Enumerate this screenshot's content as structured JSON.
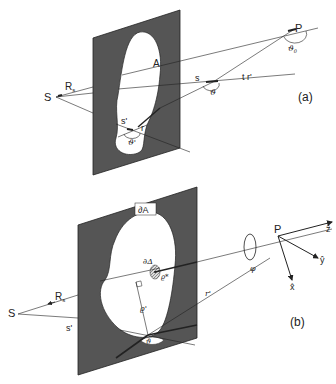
{
  "figure_a": {
    "panel_label": "(a)",
    "labels": {
      "source": "S",
      "point": "P",
      "aperture": "A",
      "Rs": "R",
      "Rs_sub": "s",
      "s": "s",
      "t_r": "t r'",
      "theta": "ϑ",
      "theta0": "ϑ",
      "theta0_sub": "0",
      "s_prime": "s'",
      "r": "r",
      "theta_prime": "ϑ'"
    }
  },
  "figure_b": {
    "panel_label": "(b)",
    "labels": {
      "source": "S",
      "point": "P",
      "boundary": "∂A",
      "delta": "∂Δ",
      "rho_star": "ϱ*",
      "rho_prime": "ϱ'",
      "Rs": "R",
      "Rs_sub": "s",
      "s_prime": "s'",
      "r_prime": "r'",
      "phi": "φ",
      "theta": "ϑ",
      "axis_z": "ẑ",
      "axis_y": "ŷ",
      "axis_x": "x̂"
    }
  },
  "colors": {
    "plate": "#555555",
    "line": "#222222",
    "aperture": "#ffffff"
  }
}
